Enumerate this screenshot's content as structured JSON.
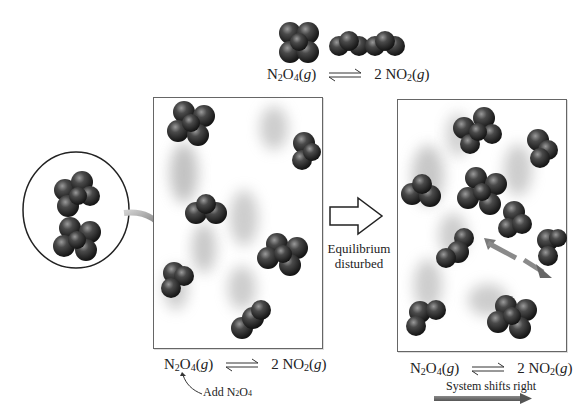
{
  "top_equation": {
    "reactant": {
      "formula_main": "N",
      "sub1": "2",
      "mid": "O",
      "sub2": "4",
      "state": "g"
    },
    "product": {
      "coef": "2",
      "formula_main": "NO",
      "sub1": "2",
      "state": "g"
    },
    "arrow": "equilibrium-arrows"
  },
  "left_panel": {
    "equation": {
      "reactant": {
        "formula_main": "N",
        "sub1": "2",
        "mid": "O",
        "sub2": "4",
        "state": "g"
      },
      "product": {
        "coef": "2",
        "formula_main": "NO",
        "sub1": "2",
        "state": "g"
      }
    },
    "annotation": {
      "text_main": "Add N",
      "sub1": "2",
      "mid": "O",
      "sub2": "4"
    },
    "molecules": {
      "N2O4": 3,
      "NO2": 3
    }
  },
  "inset_circle": {
    "molecules": {
      "N2O4": 2
    }
  },
  "middle": {
    "arrow_icon": "hollow-right-arrow",
    "label_line1": "Equilibrium",
    "label_line2": "disturbed"
  },
  "right_panel": {
    "equation": {
      "reactant": {
        "formula_main": "N",
        "sub1": "2",
        "mid": "O",
        "sub2": "4",
        "state": "g"
      },
      "product": {
        "coef": "2",
        "formula_main": "NO",
        "sub1": "2",
        "state": "g"
      }
    },
    "shift_label": "System shifts right",
    "molecules": {
      "N2O4": 3,
      "NO2": 6
    }
  },
  "colors": {
    "molecule": "#2b2b2b",
    "molecule_highlight": "#8a8a8a",
    "arrow_gray": "#7a7a7a",
    "box_border": "#666666",
    "shift_arrow": "#6f6f6f"
  }
}
